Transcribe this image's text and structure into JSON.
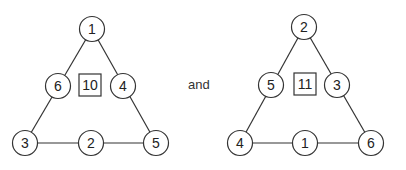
{
  "connector": "and",
  "triangles": [
    {
      "sum": "10",
      "nodes": {
        "top": "1",
        "left_mid": "6",
        "right_mid": "4",
        "bottom_left": "3",
        "bottom_mid": "2",
        "bottom_right": "5"
      }
    },
    {
      "sum": "11",
      "nodes": {
        "top": "2",
        "left_mid": "5",
        "right_mid": "3",
        "bottom_left": "4",
        "bottom_mid": "1",
        "bottom_right": "6"
      }
    }
  ],
  "colors": {
    "stroke": "#333333",
    "text": "#222222",
    "background": "#ffffff"
  }
}
